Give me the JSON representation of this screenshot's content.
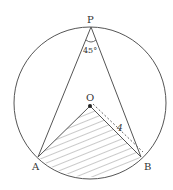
{
  "diagram": {
    "type": "geometry-circle-inscribed-angle",
    "points": {
      "P": {
        "label": "P",
        "x": 91,
        "y": 27
      },
      "O": {
        "label": "O",
        "x": 90,
        "y": 106
      },
      "A": {
        "label": "A",
        "x": 38,
        "y": 157
      },
      "B": {
        "label": "B",
        "x": 141,
        "y": 157
      }
    },
    "circle": {
      "cx": 90,
      "cy": 103,
      "r": 76
    },
    "angle_label": "45°",
    "length_label": "4",
    "shaded_region": "segment bounded by OA, OB and arc AB",
    "colors": {
      "stroke": "#555555",
      "hatch": "#777777",
      "background": "#ffffff"
    }
  }
}
